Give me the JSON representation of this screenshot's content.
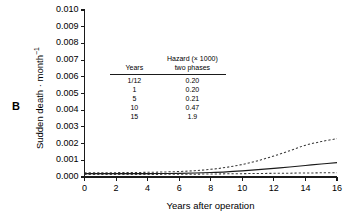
{
  "panel": {
    "letter": "B"
  },
  "chart_data": {
    "type": "line",
    "title": "",
    "xlabel": "Years after operation",
    "ylabel": "Sudden death · month⁻¹",
    "xlim": [
      0,
      16
    ],
    "ylim": [
      0,
      0.01
    ],
    "xticks": [
      0,
      2,
      4,
      6,
      8,
      10,
      12,
      14,
      16
    ],
    "xtick_labels": [
      "0",
      "2",
      "4",
      "6",
      "8",
      "10",
      "12",
      "14",
      "16"
    ],
    "yticks": [
      0.0,
      0.001,
      0.002,
      0.003,
      0.004,
      0.005,
      0.006,
      0.007,
      0.008,
      0.009,
      0.01
    ],
    "ytick_labels": [
      "0.000",
      "0.001",
      "0.002",
      "0.003",
      "0.004",
      "0.005",
      "0.006",
      "0.007",
      "0.008",
      "0.009",
      "0.010"
    ],
    "grid": false,
    "legend": "none",
    "series": [
      {
        "name": "hazard-estimate",
        "style": "solid",
        "color": "#1a1a1a",
        "x": [
          0,
          1,
          2,
          3,
          4,
          5,
          6,
          7,
          8,
          9,
          10,
          11,
          12,
          13,
          14,
          15,
          16
        ],
        "values": [
          0.0002,
          0.0002,
          0.0002,
          0.0002,
          0.0002,
          0.00021,
          0.00022,
          0.00024,
          0.00027,
          0.00031,
          0.00037,
          0.00044,
          0.00052,
          0.0006,
          0.00069,
          0.00078,
          0.00086
        ]
      },
      {
        "name": "upper-confidence-limit",
        "style": "dashed",
        "color": "#3a3a3a",
        "x": [
          0,
          1,
          2,
          3,
          4,
          5,
          6,
          7,
          8,
          9,
          10,
          11,
          12,
          13,
          14,
          15,
          16
        ],
        "values": [
          0.00026,
          0.00026,
          0.00026,
          0.00027,
          0.00028,
          0.0003,
          0.00033,
          0.00038,
          0.00046,
          0.00058,
          0.00075,
          0.00098,
          0.00126,
          0.00157,
          0.0019,
          0.00212,
          0.0023
        ]
      },
      {
        "name": "lower-confidence-limit",
        "style": "dashed",
        "color": "#3a3a3a",
        "x": [
          0,
          1,
          2,
          3,
          4,
          5,
          6,
          7,
          8,
          9,
          10,
          11,
          12,
          13,
          14,
          15,
          16
        ],
        "values": [
          0.00015,
          0.00015,
          0.00015,
          0.00015,
          0.00015,
          0.00016,
          0.00016,
          0.00017,
          0.00018,
          0.00019,
          0.0002,
          0.00021,
          0.00022,
          0.00023,
          0.00024,
          0.00025,
          0.00026
        ]
      }
    ]
  },
  "inset_table": {
    "header": {
      "col1": "Years",
      "col2_line1": "Hazard (× 1000)",
      "col2_line2": "two phases"
    },
    "rows": [
      {
        "years": "1/12",
        "hazard": "0.20"
      },
      {
        "years": "1",
        "hazard": "0.20"
      },
      {
        "years": "5",
        "hazard": "0.21"
      },
      {
        "years": "10",
        "hazard": "0.47"
      },
      {
        "years": "15",
        "hazard": "1.9"
      }
    ]
  },
  "colors": {
    "axis": "#1a1a1a",
    "solid_line": "#1a1a1a",
    "dashed_line": "#3a3a3a",
    "background": "#ffffff"
  }
}
